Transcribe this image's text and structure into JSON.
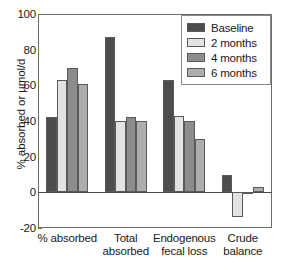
{
  "chart_data": {
    "type": "bar",
    "title": "",
    "subtitle": "",
    "xlabel": "",
    "ylabel": "% absorbed or µmol/d",
    "ylim": [
      -20,
      100
    ],
    "yticks": [
      -20,
      0,
      20,
      40,
      60,
      80,
      100
    ],
    "ytick_labels": [
      "-20",
      "0",
      "20",
      "40",
      "60",
      "80",
      "100"
    ],
    "grid": false,
    "legend_position": "top-right",
    "categories": [
      "% absorbed",
      "Total absorbed",
      "Endogenous fecal loss",
      "Crude balance"
    ],
    "category_lines": [
      [
        "% absorbed"
      ],
      [
        "Total",
        "absorbed"
      ],
      [
        "Endogenous",
        "fecal loss"
      ],
      [
        "Crude",
        "balance"
      ]
    ],
    "series": [
      {
        "name": "Baseline",
        "color": "#4d4d4d",
        "values": [
          42,
          87,
          63,
          10
        ]
      },
      {
        "name": "2 months",
        "color": "#e2e2e2",
        "values": [
          63,
          40,
          43,
          -14
        ]
      },
      {
        "name": "4 months",
        "color": "#8c8c8c",
        "values": [
          70,
          42,
          40,
          -1
        ]
      },
      {
        "name": "6 months",
        "color": "#adadad",
        "values": [
          61,
          40,
          30,
          3
        ]
      }
    ],
    "zero_line": 0,
    "axis_color": "#6e6e6e",
    "bar_edge_color": "#5a5a5a",
    "text_color": "#1a1a1a"
  },
  "legend": {
    "entries": [
      {
        "label": "Baseline"
      },
      {
        "label": "2 months"
      },
      {
        "label": "4 months"
      },
      {
        "label": "6 months"
      }
    ]
  }
}
